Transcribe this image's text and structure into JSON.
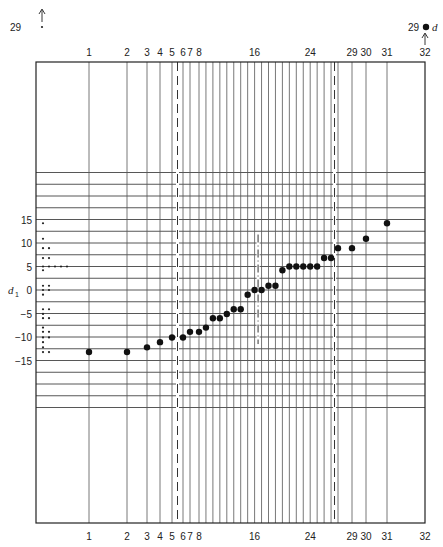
{
  "chart_data": {
    "type": "scatter",
    "title": "",
    "xlabel": "rank (1..32)",
    "ylabel": "d1",
    "ylabel_subscript": "1",
    "ylabel_base": "d",
    "ylim": [
      -25,
      25
    ],
    "y_ticks": [
      15,
      10,
      5,
      0,
      -5,
      -10,
      -15
    ],
    "y_tick_labels": [
      "15",
      "10",
      "5",
      "0",
      "−5",
      "−10",
      "−15"
    ],
    "x_tick_labels": [
      "1",
      "2",
      "3",
      "4",
      "5",
      "6",
      "7",
      "8",
      "16",
      "24",
      "29",
      "30",
      "31",
      "32"
    ],
    "x_tick_positions": [
      1,
      2,
      3,
      4,
      5,
      6,
      7,
      8,
      16,
      24,
      29,
      30,
      31,
      32
    ],
    "grid": true,
    "points": [
      {
        "rank": 1,
        "d1": -13.2
      },
      {
        "rank": 2,
        "d1": -13.2
      },
      {
        "rank": 3,
        "d1": -12.2
      },
      {
        "rank": 4,
        "d1": -11.1
      },
      {
        "rank": 5,
        "d1": -10.1
      },
      {
        "rank": 6,
        "d1": -10.1
      },
      {
        "rank": 7,
        "d1": -8.9
      },
      {
        "rank": 8,
        "d1": -8.9
      },
      {
        "rank": 9,
        "d1": -8.0
      },
      {
        "rank": 10,
        "d1": -6.0
      },
      {
        "rank": 11,
        "d1": -6.0
      },
      {
        "rank": 12,
        "d1": -5.1
      },
      {
        "rank": 13,
        "d1": -4.1
      },
      {
        "rank": 14,
        "d1": -4.1
      },
      {
        "rank": 15,
        "d1": -1.0
      },
      {
        "rank": 16,
        "d1": 0.0
      },
      {
        "rank": 17,
        "d1": 0.0
      },
      {
        "rank": 18,
        "d1": 0.9
      },
      {
        "rank": 19,
        "d1": 0.9
      },
      {
        "rank": 20,
        "d1": 4.2
      },
      {
        "rank": 21,
        "d1": 5.0
      },
      {
        "rank": 22,
        "d1": 5.0
      },
      {
        "rank": 23,
        "d1": 5.0
      },
      {
        "rank": 24,
        "d1": 5.0
      },
      {
        "rank": 25,
        "d1": 5.0
      },
      {
        "rank": 26,
        "d1": 6.8
      },
      {
        "rank": 27,
        "d1": 6.8
      },
      {
        "rank": 28,
        "d1": 8.9
      },
      {
        "rank": 29,
        "d1": 8.9
      },
      {
        "rank": 30,
        "d1": 10.9
      },
      {
        "rank": 31,
        "d1": 14.2
      }
    ],
    "outlier_annotation": {
      "label": "29",
      "marker_label": "d",
      "arrow_to": "32"
    },
    "left_dotplot_label": "29",
    "dashed_lines_at_ranks": [
      5.5,
      27.5
    ],
    "dash_dot_line": {
      "rank": 16.5,
      "from": -11.5,
      "to": 11.8
    }
  },
  "labels": {
    "top_left_count": "29",
    "top_right_count": "29",
    "legend_symbol": "d",
    "y_axis_label": "d",
    "y_axis_sub": "1"
  }
}
